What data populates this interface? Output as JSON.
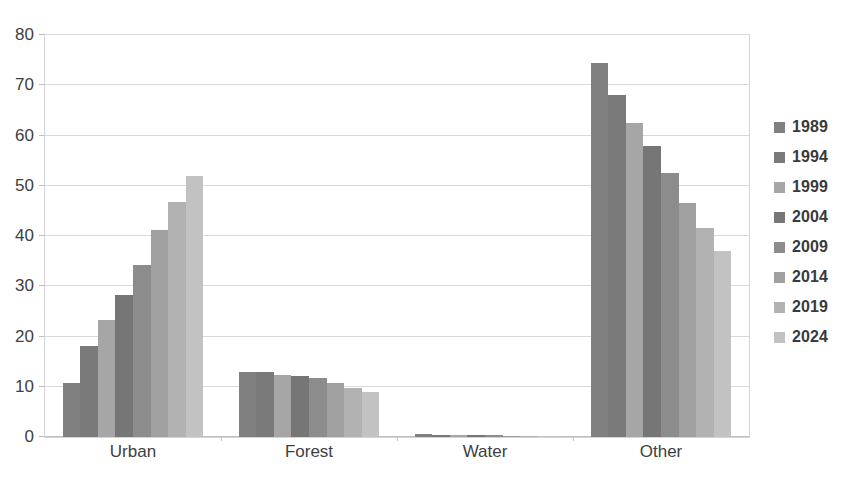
{
  "chart_data": {
    "type": "bar",
    "title": "",
    "subtitle": "",
    "xlabel": "",
    "ylabel": "",
    "categories": [
      "Urban",
      "Forest",
      "Water",
      "Other"
    ],
    "ylim": [
      0,
      80
    ],
    "ytick_labels": [
      "0",
      "10",
      "20",
      "30",
      "40",
      "50",
      "60",
      "70",
      "80"
    ],
    "ytick_values": [
      0,
      10,
      20,
      30,
      40,
      50,
      60,
      70,
      80
    ],
    "grid": true,
    "legend_position": "right",
    "orientation": "vertical",
    "grouping": "grouped",
    "series": [
      {
        "name": "1989",
        "color": "#808080",
        "values": [
          10.8,
          13.0,
          0.6,
          74.5
        ]
      },
      {
        "name": "1994",
        "color": "#7a7a7a",
        "values": [
          18.2,
          13.0,
          0.5,
          68.0
        ]
      },
      {
        "name": "1999",
        "color": "#a6a6a6",
        "values": [
          23.2,
          12.3,
          0.5,
          62.5
        ]
      },
      {
        "name": "2004",
        "color": "#767676",
        "values": [
          28.2,
          12.2,
          0.4,
          58.0
        ]
      },
      {
        "name": "2009",
        "color": "#8c8c8c",
        "values": [
          34.3,
          11.8,
          0.4,
          52.5
        ]
      },
      {
        "name": "2014",
        "color": "#a0a0a0",
        "values": [
          41.2,
          10.8,
          0.3,
          46.5
        ]
      },
      {
        "name": "2019",
        "color": "#b2b2b2",
        "values": [
          46.8,
          9.8,
          0.3,
          41.5
        ]
      },
      {
        "name": "2024",
        "color": "#c2c2c2",
        "values": [
          52.0,
          8.9,
          0.2,
          37.0
        ]
      }
    ]
  },
  "legend": {
    "entries": [
      "1989",
      "1994",
      "1999",
      "2004",
      "2009",
      "2014",
      "2019",
      "2024"
    ]
  },
  "axes": {
    "y_ticks": [
      "0",
      "10",
      "20",
      "30",
      "40",
      "50",
      "60",
      "70",
      "80"
    ],
    "x_categories": [
      "Urban",
      "Forest",
      "Water",
      "Other"
    ]
  },
  "colors": {
    "plot_border": "#d4d4d4",
    "gridline": "#d9d9d9",
    "tick_text": "#404040",
    "legend_text": "#3a3a3a"
  }
}
